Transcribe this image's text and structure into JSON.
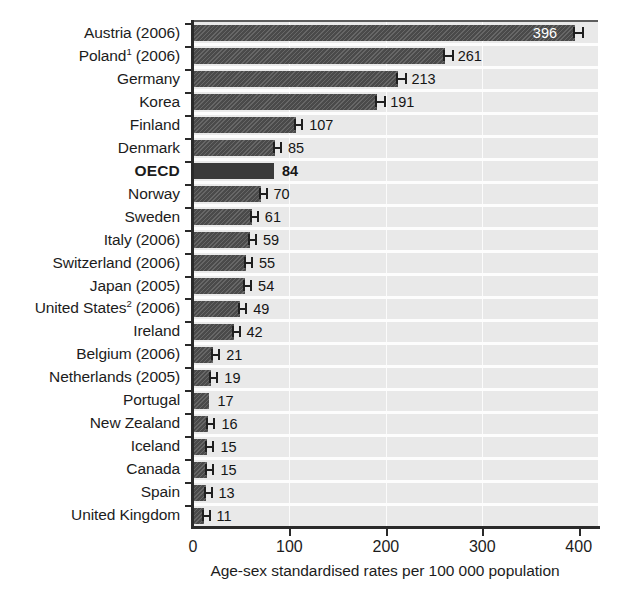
{
  "chart_data": {
    "type": "bar",
    "orientation": "horizontal",
    "title": "",
    "xlabel": "Age-sex standardised rates per 100 000 population",
    "ylabel": "",
    "xlim": [
      0,
      420
    ],
    "xticks": [
      "0",
      "100",
      "200",
      "300",
      "400"
    ],
    "xtick_values": [
      0,
      100,
      200,
      300,
      400
    ],
    "grid": "vertical gridlines at 100, 200, 300",
    "legend": "none",
    "highlight_category": "OECD",
    "has_error_bars": true,
    "categories": [
      "Austria (2006)",
      "Poland¹ (2006)",
      "Germany",
      "Korea",
      "Finland",
      "Denmark",
      "OECD",
      "Norway",
      "Sweden",
      "Italy (2006)",
      "Switzerland (2006)",
      "Japan (2005)",
      "United States² (2006)",
      "Ireland",
      "Belgium (2006)",
      "Netherlands (2005)",
      "Portugal",
      "New Zealand",
      "Iceland",
      "Canada",
      "Spain",
      "United Kingdom"
    ],
    "values": [
      396,
      261,
      213,
      191,
      107,
      85,
      84,
      70,
      61,
      59,
      55,
      54,
      49,
      42,
      21,
      19,
      17,
      16,
      15,
      15,
      13,
      11
    ],
    "rows": [
      {
        "label": "Austria",
        "suffix": " (2006)",
        "sup": "",
        "value": 396,
        "value_text": "396",
        "label_inside": true,
        "whisker": true,
        "highlight": false
      },
      {
        "label": "Poland",
        "suffix": " (2006)",
        "sup": "1",
        "value": 261,
        "value_text": "261",
        "label_inside": false,
        "whisker": true,
        "highlight": false
      },
      {
        "label": "Germany",
        "suffix": "",
        "sup": "",
        "value": 213,
        "value_text": "213",
        "label_inside": false,
        "whisker": true,
        "highlight": false
      },
      {
        "label": "Korea",
        "suffix": "",
        "sup": "",
        "value": 191,
        "value_text": "191",
        "label_inside": false,
        "whisker": true,
        "highlight": false
      },
      {
        "label": "Finland",
        "suffix": "",
        "sup": "",
        "value": 107,
        "value_text": "107",
        "label_inside": false,
        "whisker": true,
        "highlight": false
      },
      {
        "label": "Denmark",
        "suffix": "",
        "sup": "",
        "value": 85,
        "value_text": "85",
        "label_inside": false,
        "whisker": true,
        "highlight": false
      },
      {
        "label": "OECD",
        "suffix": "",
        "sup": "",
        "value": 84,
        "value_text": "84",
        "label_inside": false,
        "whisker": false,
        "highlight": true
      },
      {
        "label": "Norway",
        "suffix": "",
        "sup": "",
        "value": 70,
        "value_text": "70",
        "label_inside": false,
        "whisker": true,
        "highlight": false
      },
      {
        "label": "Sweden",
        "suffix": "",
        "sup": "",
        "value": 61,
        "value_text": "61",
        "label_inside": false,
        "whisker": true,
        "highlight": false
      },
      {
        "label": "Italy",
        "suffix": " (2006)",
        "sup": "",
        "value": 59,
        "value_text": "59",
        "label_inside": false,
        "whisker": true,
        "highlight": false
      },
      {
        "label": "Switzerland",
        "suffix": " (2006)",
        "sup": "",
        "value": 55,
        "value_text": "55",
        "label_inside": false,
        "whisker": true,
        "highlight": false
      },
      {
        "label": "Japan",
        "suffix": " (2005)",
        "sup": "",
        "value": 54,
        "value_text": "54",
        "label_inside": false,
        "whisker": true,
        "highlight": false
      },
      {
        "label": "United States",
        "suffix": " (2006)",
        "sup": "2",
        "value": 49,
        "value_text": "49",
        "label_inside": false,
        "whisker": true,
        "highlight": false
      },
      {
        "label": "Ireland",
        "suffix": "",
        "sup": "",
        "value": 42,
        "value_text": "42",
        "label_inside": false,
        "whisker": true,
        "highlight": false
      },
      {
        "label": "Belgium",
        "suffix": " (2006)",
        "sup": "",
        "value": 21,
        "value_text": "21",
        "label_inside": false,
        "whisker": true,
        "highlight": false
      },
      {
        "label": "Netherlands",
        "suffix": " (2005)",
        "sup": "",
        "value": 19,
        "value_text": "19",
        "label_inside": false,
        "whisker": true,
        "highlight": false
      },
      {
        "label": "Portugal",
        "suffix": "",
        "sup": "",
        "value": 17,
        "value_text": "17",
        "label_inside": false,
        "whisker": false,
        "highlight": false
      },
      {
        "label": "New Zealand",
        "suffix": "",
        "sup": "",
        "value": 16,
        "value_text": "16",
        "label_inside": false,
        "whisker": true,
        "highlight": false
      },
      {
        "label": "Iceland",
        "suffix": "",
        "sup": "",
        "value": 15,
        "value_text": "15",
        "label_inside": false,
        "whisker": true,
        "highlight": false
      },
      {
        "label": "Canada",
        "suffix": "",
        "sup": "",
        "value": 15,
        "value_text": "15",
        "label_inside": false,
        "whisker": true,
        "highlight": false
      },
      {
        "label": "Spain",
        "suffix": "",
        "sup": "",
        "value": 13,
        "value_text": "13",
        "label_inside": false,
        "whisker": true,
        "highlight": false
      },
      {
        "label": "United Kingdom",
        "suffix": "",
        "sup": "",
        "value": 11,
        "value_text": "11",
        "label_inside": false,
        "whisker": true,
        "highlight": false
      }
    ],
    "colors": {
      "bar": "#4a4a4a",
      "bar_highlight": "#3a3a3a",
      "plot_background": "#e9e9e9",
      "gridline": "#fbfbfb",
      "axis": "#2a2a2a",
      "text": "#1c1c1c",
      "value_inside_text": "#ffffff"
    }
  }
}
